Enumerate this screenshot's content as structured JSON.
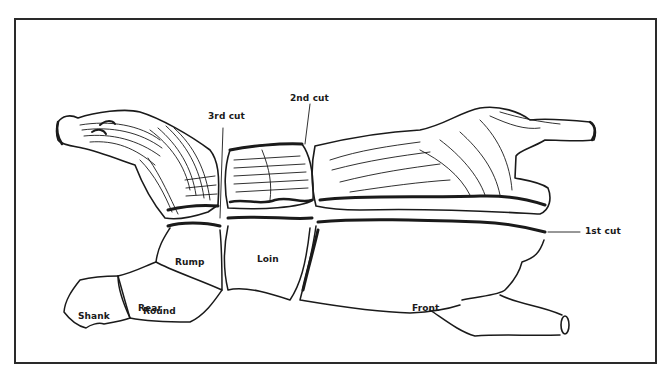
{
  "diagram": {
    "labels": {
      "cut_3": "3rd cut",
      "cut_2": "2nd cut",
      "cut_1": "1st cut",
      "rump": "Rump",
      "loin": "Loin",
      "shank": "Shank",
      "round": "Round",
      "rear": "Rear",
      "front": "Front"
    },
    "colors": {
      "ink": "#1a1a1a",
      "background": "#ffffff",
      "frame": "#2a2a2a"
    }
  }
}
